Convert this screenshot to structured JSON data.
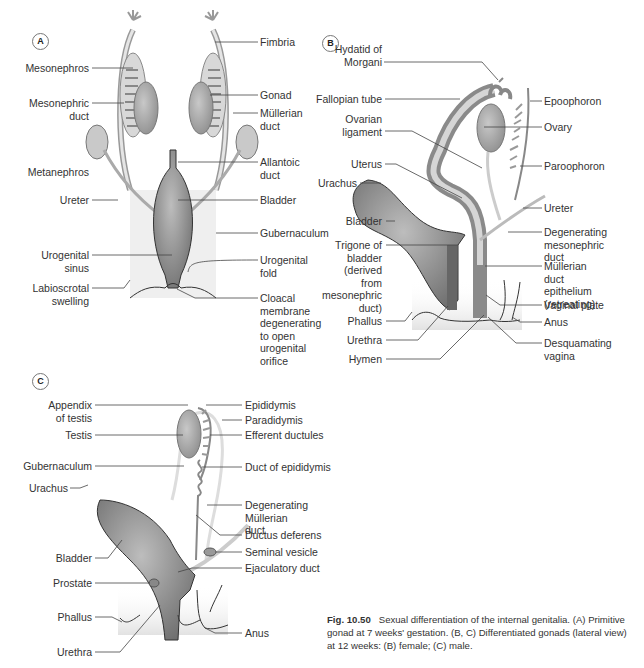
{
  "figure": {
    "number": "Fig. 10.50",
    "caption": "Sexual differentiation of the internal genitalia. (A) Primitive gonad at 7 weeks' gestation. (B, C) Differentiated gonads (lateral view) at 12 weeks: (B) female; (C) male."
  },
  "panels": {
    "A": {
      "badge": "A",
      "title": "Primitive gonad at 7 weeks' gestation",
      "labels_left": [
        "Mesonephros",
        "Mesonephric duct",
        "Metanephros",
        "Ureter",
        "Urogenital sinus",
        "Labioscrotal swelling"
      ],
      "labels_right": [
        "Fimbria",
        "Gonad",
        "Müllerian duct",
        "Allantoic duct",
        "Bladder",
        "Gubernaculum",
        "Urogenital fold",
        "Cloacal membrane degenerating to open urogenital orifice"
      ]
    },
    "B": {
      "badge": "B",
      "title": "Female, lateral view at 12 weeks",
      "labels_left": [
        "Hydatid of Morgani",
        "Fallopian tube",
        "Ovarian ligament",
        "Uterus",
        "Urachus",
        "Bladder",
        "Trigone of bladder (derived from mesonephric duct)",
        "Phallus",
        "Urethra",
        "Hymen"
      ],
      "labels_right": [
        "Epoophoron",
        "Ovary",
        "Paroophoron",
        "Ureter",
        "Degenerating mesonephric duct",
        "Müllerian duct epithelium (retreating)",
        "Vaginal plate",
        "Anus",
        "Desquamating vagina"
      ]
    },
    "C": {
      "badge": "C",
      "title": "Male, lateral view at 12 weeks",
      "labels_left": [
        "Appendix of testis",
        "Testis",
        "Gubernaculum",
        "Urachus",
        "Bladder",
        "Prostate",
        "Phallus",
        "Urethra"
      ],
      "labels_right": [
        "Epididymis",
        "Paradidymis",
        "Efferent ductules",
        "Duct of epididymis",
        "Degenerating Müllerian duct",
        "Ductus deferens",
        "Seminal vesicle",
        "Ejaculatory duct",
        "Anus"
      ]
    }
  },
  "colors": {
    "organ_dark": "#7a7a7a",
    "organ_mid": "#9a9a9a",
    "organ_light": "#c4c4c4",
    "tissue_bg": "#ececec",
    "leader_line": "#444444"
  }
}
